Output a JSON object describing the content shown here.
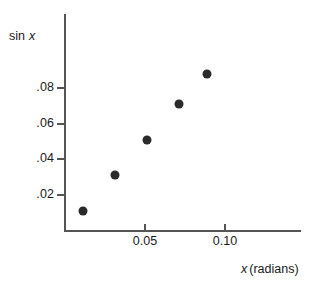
{
  "chart_data": {
    "type": "scatter",
    "title": "",
    "xlabel": "x (radians)",
    "ylabel": "sin x",
    "xlabel_parts": {
      "variable": "x",
      "rest": "(radians)"
    },
    "ylabel_parts": {
      "prefix": "sin",
      "variable": "x"
    },
    "x": [
      0.011,
      0.031,
      0.051,
      0.071,
      0.089
    ],
    "values": [
      0.011,
      0.031,
      0.051,
      0.071,
      0.0875
    ],
    "points": [
      {
        "x": 0.011,
        "y": 0.011
      },
      {
        "x": 0.031,
        "y": 0.031
      },
      {
        "x": 0.051,
        "y": 0.051
      },
      {
        "x": 0.071,
        "y": 0.071
      },
      {
        "x": 0.089,
        "y": 0.0875
      }
    ],
    "xlim": [
      0.0,
      0.1475
    ],
    "ylim": [
      0.0,
      0.1212
    ],
    "xticks": [
      0.05,
      0.1
    ],
    "xtick_labels": [
      "0.05",
      "0.10"
    ],
    "yticks": [
      0.02,
      0.04,
      0.06,
      0.08
    ],
    "ytick_labels": [
      ".02",
      ".04",
      ".06",
      ".08"
    ],
    "grid": false,
    "legend": null,
    "marker": "filled-circle",
    "marker_color": "#2b2b2b",
    "axis_color": "#555555",
    "background": "#ffffff"
  }
}
